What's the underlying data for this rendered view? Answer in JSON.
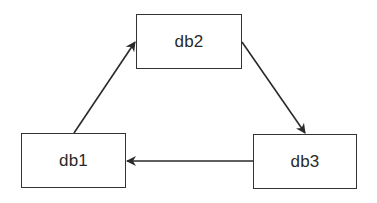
{
  "diagram": {
    "type": "replication-cycle",
    "nodes": [
      {
        "id": "db1",
        "label": "db1"
      },
      {
        "id": "db2",
        "label": "db2"
      },
      {
        "id": "db3",
        "label": "db3"
      }
    ],
    "edges": [
      {
        "from": "db1",
        "to": "db2"
      },
      {
        "from": "db2",
        "to": "db3"
      },
      {
        "from": "db3",
        "to": "db1"
      }
    ],
    "colors": {
      "stroke": "#333333",
      "text": "#2a2a2a",
      "background": "#ffffff"
    }
  }
}
